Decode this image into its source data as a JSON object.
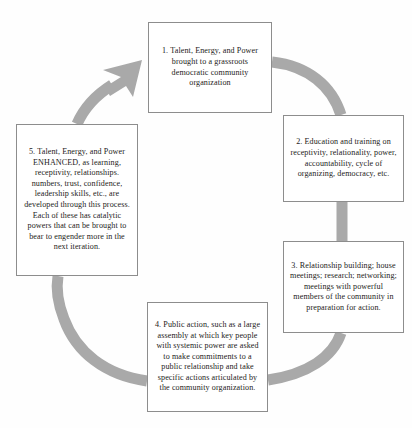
{
  "diagram": {
    "type": "circular-process-cycle",
    "direction": "clockwise",
    "stage_count": 5,
    "colors": {
      "arc": "#a9a9a9",
      "box_border": "#8d8d8d",
      "box_fill": "#ffffff",
      "text": "#1d1b1a",
      "page_background": "#fefefe"
    },
    "stages": [
      {
        "number": "1",
        "text": "1. Talent, Energy, and Power brought to a grassroots democratic community organization"
      },
      {
        "number": "2",
        "text": "2. Education and training on receptivity, relationality, power, accountability, cycle of organizing, democracy, etc."
      },
      {
        "number": "3",
        "text": "3. Relationship building; house meetings; research; networking; meetings with powerful members of the community in preparation for action."
      },
      {
        "number": "4",
        "text": "4. Public action, such as a large assembly at which key people with systemic power are asked to make commitments to a public relationship and take specific actions articulated by the community organization."
      },
      {
        "number": "5",
        "text": "5. Talent, Energy, and Power ENHANCED, as learning, receptivity, relationships. numbers, trust, confidence, leadership skills, etc., are developed through this process. Each of these has catalytic powers that can be brought to bear to engender more in the next iteration."
      }
    ],
    "connectors": [
      {
        "from": "1",
        "to": "2",
        "arrowhead": false
      },
      {
        "from": "2",
        "to": "3",
        "arrowhead": false
      },
      {
        "from": "3",
        "to": "4",
        "arrowhead": false
      },
      {
        "from": "4",
        "to": "5",
        "arrowhead": false
      },
      {
        "from": "5",
        "to": "1",
        "arrowhead": true
      }
    ]
  }
}
